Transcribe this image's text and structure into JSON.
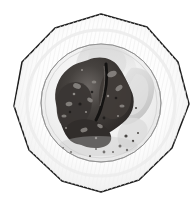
{
  "image": {
    "kind": "photograph",
    "subject": "plate-of-food",
    "description": "Overhead photograph of a white decagonal-rimmed dinner plate holding a dark mass of roasted food, with scattered crumbs on the plate well.",
    "tone": "grayscale",
    "background_color": "#ffffff"
  },
  "frame": {
    "width": 196,
    "height": 202,
    "left_rule_color": "#c9cccd",
    "left_rule_x": 4
  },
  "plate": {
    "name": "dinner-plate",
    "shape": "decagon-rim-round-well",
    "rim_fill": "#fbfbfb",
    "rim_outline_color": "#1e1e1e",
    "rim_outline_width": 1.4,
    "well_fill": "#f3f3f3",
    "well_outline_color": "#6e6e6e",
    "center_x": 101,
    "center_y": 103,
    "outer_radius": 88,
    "well_radius": 58,
    "bottom_clipped": true
  },
  "food": {
    "name": "roasted-food-portion",
    "color_dark": "#2f2d2c",
    "color_mid": "#5a5653",
    "color_light": "#8e8a86",
    "crumbs_color": "#4a4745",
    "garnish_color": "#d6d6d6",
    "crumb_count": 14
  },
  "colors": {
    "white": "#ffffff",
    "off_white": "#fbfbfb",
    "rim_shade": "#ededed",
    "well_shade": "#e6e6e6",
    "outline": "#1e1e1e",
    "soft_gray": "#bdbdbd"
  }
}
